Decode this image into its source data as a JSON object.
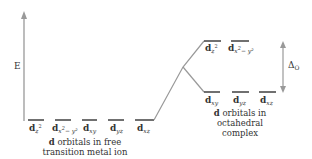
{
  "diagram": {
    "axis_label": "E",
    "splitting_label": "Δ",
    "splitting_sub": "O",
    "colors": {
      "line": "#222222",
      "connector": "#999999",
      "arrow": "#999999"
    },
    "free_ion": {
      "caption_bold": "d",
      "caption_line1": " orbitals in free",
      "caption_line2": "transition metal ion",
      "orbitals": [
        {
          "d": "d",
          "sub": "z",
          "sup": "2",
          "tail": ""
        },
        {
          "d": "d",
          "sub": "x",
          "sup": "2",
          "tail": "− y²"
        },
        {
          "d": "d",
          "sub": "xy",
          "sup": "",
          "tail": ""
        },
        {
          "d": "d",
          "sub": "yz",
          "sup": "",
          "tail": ""
        },
        {
          "d": "d",
          "sub": "xz",
          "sup": "",
          "tail": ""
        }
      ]
    },
    "octahedral": {
      "caption_bold": "d",
      "caption_line1": " orbitals in",
      "caption_line2": "octahedral",
      "caption_line3": "complex",
      "eg": [
        {
          "d": "d",
          "sub": "z",
          "sup": "2",
          "tail": ""
        },
        {
          "d": "d",
          "sub": "x",
          "sup": "2",
          "tail": "− y²"
        }
      ],
      "t2g": [
        {
          "d": "d",
          "sub": "xy"
        },
        {
          "d": "d",
          "sub": "yz"
        },
        {
          "d": "d",
          "sub": "xz"
        }
      ]
    }
  }
}
